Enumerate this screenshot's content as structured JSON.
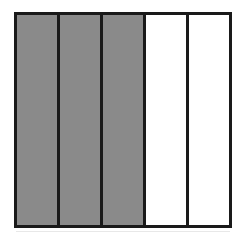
{
  "figure": {
    "name": "fraction-bar-diagram",
    "background_color": "#ffffff",
    "outline_color": "#1a1a1a",
    "outline_width_px": 3,
    "shaded_color": "#8a8a8a",
    "unshaded_color": "#ffffff",
    "total_parts": 5,
    "shaded_parts": 3,
    "unshaded_parts": 2,
    "fraction_label": "3/5",
    "bounds": {
      "x": 14,
      "y": 12,
      "width": 218,
      "height": 216
    },
    "cells": [
      {
        "index": 1,
        "state": "shaded",
        "fill": "#8a8a8a"
      },
      {
        "index": 2,
        "state": "shaded",
        "fill": "#8a8a8a"
      },
      {
        "index": 3,
        "state": "shaded",
        "fill": "#8a8a8a"
      },
      {
        "index": 4,
        "state": "unshaded",
        "fill": "#ffffff"
      },
      {
        "index": 5,
        "state": "unshaded",
        "fill": "#ffffff"
      }
    ]
  },
  "chart_data": {
    "type": "bar",
    "title": "",
    "xlabel": "",
    "ylabel": "",
    "categories": [
      "1",
      "2",
      "3",
      "4",
      "5"
    ],
    "values": [
      1,
      1,
      1,
      1,
      1
    ],
    "series": [
      {
        "name": "shading",
        "values": [
          1,
          1,
          1,
          0,
          0
        ]
      }
    ],
    "legend": [],
    "grid": false
  }
}
